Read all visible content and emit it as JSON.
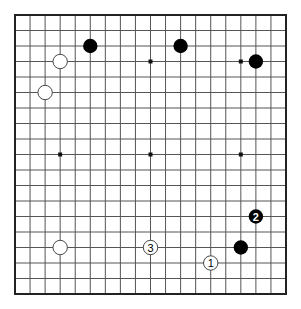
{
  "diagram": {
    "type": "go-board",
    "board_size": 19,
    "colors": {
      "line": "#555555",
      "border": "#222222",
      "black_stone": "#000000",
      "white_stone": "#ffffff",
      "white_stone_outline": "#333333",
      "star_point": "#111111",
      "background": "#ffffff"
    },
    "star_points": [
      {
        "col": 3,
        "row": 3
      },
      {
        "col": 9,
        "row": 3
      },
      {
        "col": 15,
        "row": 3
      },
      {
        "col": 3,
        "row": 9
      },
      {
        "col": 9,
        "row": 9
      },
      {
        "col": 15,
        "row": 9
      },
      {
        "col": 3,
        "row": 15
      },
      {
        "col": 9,
        "row": 15
      },
      {
        "col": 15,
        "row": 15
      }
    ],
    "stones": [
      {
        "color": "black",
        "col": 5,
        "row": 2,
        "label": ""
      },
      {
        "color": "black",
        "col": 11,
        "row": 2,
        "label": ""
      },
      {
        "color": "black",
        "col": 16,
        "row": 3,
        "label": ""
      },
      {
        "color": "white",
        "col": 3,
        "row": 3,
        "label": ""
      },
      {
        "color": "white",
        "col": 2,
        "row": 5,
        "label": ""
      },
      {
        "color": "white",
        "col": 3,
        "row": 15,
        "label": ""
      },
      {
        "color": "black",
        "col": 15,
        "row": 15,
        "label": ""
      },
      {
        "color": "white",
        "col": 13,
        "row": 16,
        "label": "1"
      },
      {
        "color": "black",
        "col": 16,
        "row": 13,
        "label": "2"
      },
      {
        "color": "white",
        "col": 9,
        "row": 15,
        "label": "3"
      }
    ]
  }
}
